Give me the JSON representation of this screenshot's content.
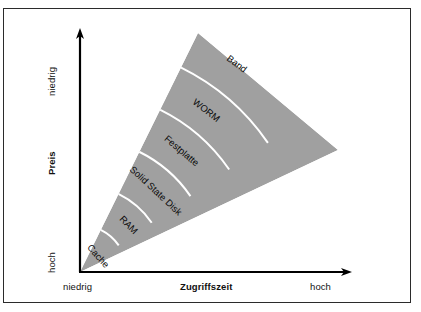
{
  "figure": {
    "kind": "storage-hierarchy-wedge-diagram",
    "frame_border_color": "#2b2b2b",
    "background_color": "#ffffff",
    "wedge_fill_color": "#a0a0a0",
    "wedge_separator_color": "#ffffff",
    "axis_color": "#000000"
  },
  "axes": {
    "y": {
      "title": "Preis",
      "top_label": "niedrig",
      "bottom_label": "hoch",
      "bold_title": true
    },
    "x": {
      "title": "Zugriffszeit",
      "left_label": "niedrig",
      "right_label": "hoch",
      "bold_title": true
    }
  },
  "chart_data": {
    "type": "pie",
    "title": "",
    "xlabel": "Zugriffszeit",
    "ylabel": "Preis",
    "categories": [
      "Cache",
      "RAM",
      "Solid State Disk",
      "Festplatte",
      "WORM",
      "Band"
    ],
    "values": [
      1,
      1,
      1,
      1,
      1,
      1
    ]
  },
  "segments": [
    {
      "label": "Cache",
      "index": 0
    },
    {
      "label": "RAM",
      "index": 1
    },
    {
      "label": "Solid State Disk",
      "index": 2
    },
    {
      "label": "Festplatte",
      "index": 3
    },
    {
      "label": "WORM",
      "index": 4
    },
    {
      "label": "Band",
      "index": 5
    }
  ]
}
